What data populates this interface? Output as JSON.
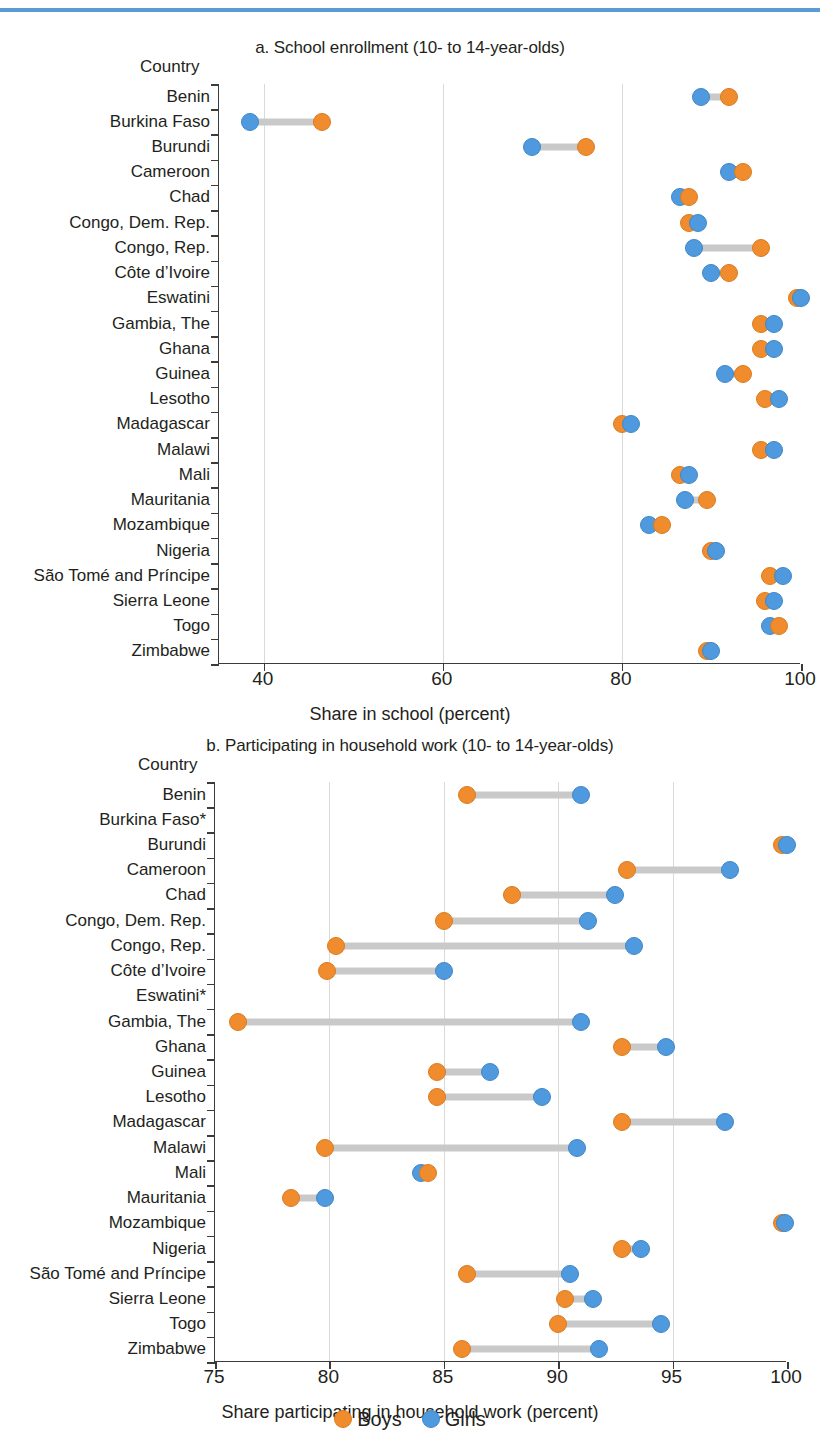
{
  "figure": {
    "legend": [
      {
        "key": "boys",
        "label": "Boys",
        "color": "#f08c2e"
      },
      {
        "key": "girls",
        "label": "Girls",
        "color": "#4f9ade"
      }
    ],
    "y_axis_title": "Country"
  },
  "chart_data": [
    {
      "type": "scatter",
      "panel": "a",
      "title": "a. School enrollment (10- to 14-year-olds)",
      "xlabel": "Share in school (percent)",
      "ylabel": "Country",
      "xlim": [
        35,
        100
      ],
      "xticks": [
        40,
        60,
        80,
        100
      ],
      "xtick_labels": [
        "40",
        "60",
        "80",
        "100"
      ],
      "grid": true,
      "legend_position": "bottom",
      "categories": [
        "Benin",
        "Burkina Faso",
        "Burundi",
        "Cameroon",
        "Chad",
        "Congo, Dem. Rep.",
        "Congo, Rep.",
        "Côte d’Ivoire",
        "Eswatini",
        "Gambia, The",
        "Ghana",
        "Guinea",
        "Lesotho",
        "Madagascar",
        "Malawi",
        "Mali",
        "Mauritania",
        "Mozambique",
        "Nigeria",
        "São Tomé and Príncipe",
        "Sierra Leone",
        "Togo",
        "Zimbabwe"
      ],
      "series": [
        {
          "name": "Boys",
          "values": [
            92.0,
            46.5,
            76.0,
            93.5,
            87.5,
            87.5,
            95.5,
            92.0,
            99.5,
            95.5,
            95.5,
            93.5,
            96.0,
            80.0,
            95.5,
            86.5,
            89.5,
            84.5,
            90.0,
            96.5,
            96.0,
            97.5,
            89.5
          ]
        },
        {
          "name": "Girls",
          "values": [
            88.8,
            38.5,
            70.0,
            92.0,
            86.5,
            88.5,
            88.0,
            90.0,
            100.0,
            97.0,
            97.0,
            91.5,
            97.5,
            81.0,
            97.0,
            87.5,
            87.0,
            83.0,
            90.5,
            98.0,
            97.0,
            96.5,
            90.0
          ]
        }
      ]
    },
    {
      "type": "scatter",
      "panel": "b",
      "title": "b. Participating in household work (10- to 14-year-olds)",
      "xlabel": "Share participating in household work (percent)",
      "ylabel": "Country",
      "xlim": [
        75,
        100
      ],
      "xticks": [
        75,
        80,
        85,
        90,
        95,
        100
      ],
      "xtick_labels": [
        "75",
        "80",
        "85",
        "90",
        "95",
        "100"
      ],
      "grid": true,
      "legend_position": "bottom",
      "categories": [
        "Benin",
        "Burkina Faso*",
        "Burundi",
        "Cameroon",
        "Chad",
        "Congo, Dem. Rep.",
        "Congo, Rep.",
        "Côte d’Ivoire",
        "Eswatini*",
        "Gambia, The",
        "Ghana",
        "Guinea",
        "Lesotho",
        "Madagascar",
        "Malawi",
        "Mali",
        "Mauritania",
        "Mozambique",
        "Nigeria",
        "São Tomé and Príncipe",
        "Sierra Leone",
        "Togo",
        "Zimbabwe"
      ],
      "series": [
        {
          "name": "Boys",
          "values": [
            86.0,
            null,
            99.8,
            93.0,
            88.0,
            85.0,
            80.3,
            79.9,
            null,
            76.0,
            92.8,
            84.7,
            84.7,
            92.8,
            79.8,
            84.3,
            78.3,
            99.8,
            92.8,
            86.0,
            90.3,
            90.0,
            85.8
          ]
        },
        {
          "name": "Girls",
          "values": [
            91.0,
            null,
            100.0,
            97.5,
            92.5,
            91.3,
            93.3,
            85.0,
            null,
            91.0,
            94.7,
            87.0,
            89.3,
            97.3,
            90.8,
            84.0,
            79.8,
            99.9,
            93.6,
            90.5,
            91.5,
            94.5,
            91.8
          ]
        }
      ]
    }
  ]
}
